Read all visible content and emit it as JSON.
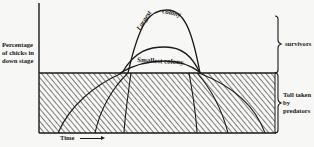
{
  "diagram": {
    "y_axis_label": "Percentage of chicks in down stage",
    "x_axis_label": "Time",
    "x_axis_arrow": "right-arrow",
    "curves": [
      {
        "label": "Largest colony",
        "description": "tall narrow bell curve"
      },
      {
        "label": "Smallest colony",
        "description": "low broad curve"
      }
    ],
    "regions": [
      {
        "label": "survivors",
        "description": "area above horizontal threshold line, marked with brace"
      },
      {
        "label": "Toll taken by predators",
        "description": "hatched area below threshold line, marked with brace"
      }
    ],
    "colors": {
      "ink": "#1a1a1a",
      "background": "#f7f7f5"
    }
  }
}
